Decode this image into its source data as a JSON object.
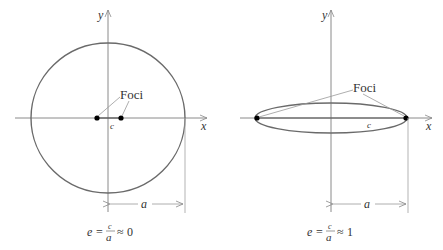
{
  "diagrams": [
    {
      "axis_x_label": "x",
      "axis_y_label": "y",
      "foci_label": "Foci",
      "c_label": "c",
      "a_label": "a",
      "formula": {
        "lhs": "e",
        "eq1": "=",
        "num": "c",
        "den": "a",
        "eq2": "≈",
        "value": "0"
      }
    },
    {
      "axis_x_label": "x",
      "axis_y_label": "y",
      "foci_label": "Foci",
      "c_label": "c",
      "a_label": "a",
      "formula": {
        "lhs": "e",
        "eq1": "=",
        "num": "c",
        "den": "a",
        "eq2": "≈",
        "value": "1"
      }
    }
  ],
  "colors": {
    "ellipse": "#6a6a6a",
    "axis": "#8a8a8a",
    "text": "#333333",
    "focus": "#000000"
  }
}
